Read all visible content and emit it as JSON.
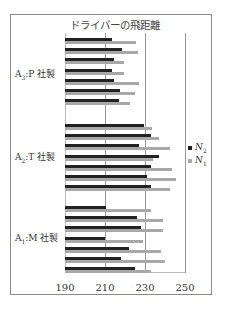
{
  "chart_data": {
    "type": "bar",
    "orientation": "horizontal",
    "title": "ドライバーの飛距離",
    "xlabel": "",
    "ylabel": "",
    "xlim": [
      190,
      250
    ],
    "xticks": [
      190,
      210,
      230,
      250
    ],
    "grid": true,
    "legend_position": "right",
    "groups": [
      {
        "label": "A3:P社製",
        "name": "A",
        "sub": "3",
        "suffix": ":P 社製"
      },
      {
        "label": "A2:T社製",
        "name": "A",
        "sub": "2",
        "suffix": ":T 社製"
      },
      {
        "label": "A1:M社製",
        "name": "A",
        "sub": "1",
        "suffix": ":M 社製"
      }
    ],
    "series": [
      {
        "name": "N2",
        "color": "#222222",
        "values": {
          "A3:P社製": [
            213.5,
            218.5,
            214.5,
            213.5,
            214.5,
            217.5,
            217
          ],
          "A2:T社製": [
            229.5,
            233,
            227,
            237,
            233,
            231,
            233
          ],
          "A1:M社製": [
            210.5,
            226,
            228,
            210,
            222,
            218,
            225
          ]
        }
      },
      {
        "name": "N1",
        "color": "#a8a8a8",
        "values": {
          "A3:P社製": [
            225.5,
            226.5,
            219.5,
            219.5,
            227,
            225,
            222.5
          ],
          "A2:T社製": [
            233.5,
            237,
            242.5,
            234,
            243.5,
            245.5,
            242.5
          ],
          "A1:M社製": [
            233,
            239,
            239,
            229,
            238,
            240,
            233
          ]
        }
      }
    ]
  },
  "legend": [
    {
      "label": "N",
      "sub": "2",
      "color": "#222222"
    },
    {
      "label": "N",
      "sub": "1",
      "color": "#a8a8a8"
    }
  ]
}
